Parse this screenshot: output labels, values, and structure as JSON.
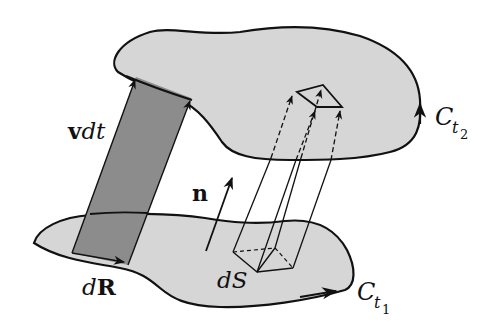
{
  "diagram": {
    "type": "surface-flux-transport",
    "colors": {
      "surface_fill": "#d6d6d6",
      "band_fill": "#8c8c8c",
      "stroke": "#111111",
      "background": "#ffffff"
    },
    "labels": {
      "velocity": {
        "bold": "v",
        "italic": "dt"
      },
      "normal": "n",
      "line_element": {
        "italic": "d",
        "bold": "R"
      },
      "area_element": "dS",
      "curve_upper": {
        "main": "C",
        "sub": "t",
        "subsub": "2"
      },
      "curve_lower": {
        "main": "C",
        "sub": "t",
        "subsub": "1"
      }
    },
    "elements": [
      "upper-surface bounded by C_t2 (orientation arrow upward on right edge)",
      "lower-surface bounded by C_t1 (orientation arrow rightward on bottom edge)",
      "swept band from dR along v dt (dark shaded parallelogram)",
      "normal vector n",
      "prism over dS with dashed extensions to upper surface"
    ]
  }
}
